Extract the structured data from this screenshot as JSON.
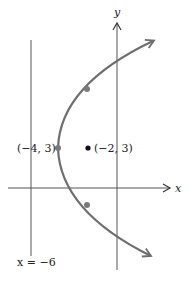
{
  "diagram": {
    "type": "parabola-graph",
    "colors": {
      "axis": "#555555",
      "curve": "#6e6e6e",
      "point": "#7a7a7a",
      "focus": "#111111",
      "text": "#222222",
      "background": "#ffffff"
    },
    "axes": {
      "x_label": "x",
      "y_label": "y"
    },
    "directrix": {
      "label": "x = −6",
      "equation": "x = -6"
    },
    "vertex": {
      "label": "(−4, 3)",
      "x": -4,
      "y": 3
    },
    "focus": {
      "label": "(−2, 3)",
      "x": -2,
      "y": 3
    },
    "curve": {
      "description": "Parabola opening right with vertex (-4, 3), focus (-2, 3), directrix x = -6",
      "equation": "(y - 3)^2 = 8(x + 4)"
    },
    "latus_rectum_points": [
      {
        "x": -2,
        "y": 7
      },
      {
        "x": -2,
        "y": -1
      }
    ]
  }
}
